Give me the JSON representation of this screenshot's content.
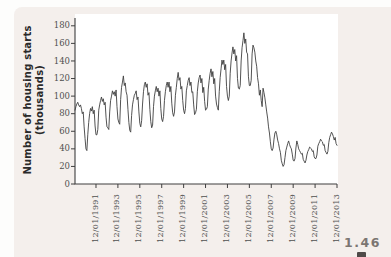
{
  "figure_number": "1.46",
  "chart_data": {
    "type": "line",
    "title": "",
    "xlabel": "",
    "ylabel": "Number of housing starts (thousands)",
    "ylabel_line1": "Number of housing starts",
    "ylabel_line2": "(thousands)",
    "ylim": [
      0,
      180
    ],
    "y_ticks": [
      180,
      160,
      140,
      120,
      100,
      80,
      60,
      40,
      20,
      0
    ],
    "grid": "off",
    "legend": "none",
    "line_color": "#3f3f3f",
    "plot_background": "#ffffff",
    "panel_background": "#f4efec",
    "x_start": "01/1990",
    "frequency_months": 1,
    "x_ticks": [
      {
        "label": "12/01/1991",
        "month_index": 23
      },
      {
        "label": "12/01/1993",
        "month_index": 47
      },
      {
        "label": "12/01/1995",
        "month_index": 71
      },
      {
        "label": "12/01/1997",
        "month_index": 95
      },
      {
        "label": "12/01/1999",
        "month_index": 119
      },
      {
        "label": "12/01/2001",
        "month_index": 143
      },
      {
        "label": "12/01/2003",
        "month_index": 167
      },
      {
        "label": "12/01/2005",
        "month_index": 191
      },
      {
        "label": "12/01/2007",
        "month_index": 215
      },
      {
        "label": "12/01/2009",
        "month_index": 239
      },
      {
        "label": "12/01/2011",
        "month_index": 263
      },
      {
        "label": "12/01/2013",
        "month_index": 287
      }
    ],
    "values": [
      84,
      88,
      91,
      93,
      90,
      88,
      90,
      86,
      80,
      82,
      65,
      52,
      40,
      38,
      56,
      70,
      80,
      86,
      83,
      88,
      80,
      84,
      66,
      56,
      56,
      62,
      84,
      90,
      95,
      99,
      94,
      97,
      90,
      93,
      76,
      65,
      64,
      62,
      82,
      95,
      100,
      106,
      102,
      105,
      100,
      107,
      88,
      74,
      70,
      68,
      96,
      110,
      116,
      123,
      112,
      115,
      105,
      101,
      85,
      70,
      61,
      59,
      78,
      90,
      96,
      101,
      103,
      106,
      96,
      99,
      82,
      69,
      65,
      72,
      91,
      105,
      113,
      116,
      110,
      114,
      101,
      104,
      85,
      71,
      64,
      67,
      88,
      100,
      106,
      111,
      105,
      109,
      100,
      106,
      86,
      74,
      71,
      77,
      95,
      105,
      112,
      116,
      110,
      116,
      105,
      111,
      92,
      81,
      77,
      82,
      101,
      110,
      120,
      127,
      118,
      121,
      108,
      111,
      95,
      84,
      80,
      86,
      106,
      112,
      118,
      121,
      112,
      116,
      104,
      105,
      90,
      79,
      81,
      85,
      105,
      115,
      121,
      124,
      115,
      120,
      104,
      110,
      94,
      84,
      85,
      88,
      108,
      118,
      126,
      131,
      122,
      128,
      114,
      120,
      100,
      91,
      87,
      84,
      105,
      121,
      131,
      141,
      136,
      141,
      130,
      136,
      111,
      100,
      95,
      100,
      126,
      140,
      149,
      156,
      148,
      153,
      140,
      146,
      120,
      109,
      108,
      112,
      140,
      155,
      163,
      172,
      160,
      165,
      150,
      148,
      122,
      112,
      112,
      118,
      148,
      158,
      155,
      150,
      140,
      134,
      121,
      114,
      101,
      107,
      95,
      88,
      109,
      104,
      98,
      90,
      82,
      75,
      65,
      58,
      48,
      40,
      38,
      41,
      51,
      58,
      60,
      56,
      50,
      46,
      40,
      36,
      27,
      23,
      20,
      22,
      30,
      38,
      42,
      46,
      49,
      45,
      42,
      40,
      34,
      27,
      26,
      29,
      41,
      49,
      45,
      40,
      38,
      36,
      34,
      35,
      28,
      26,
      24,
      27,
      33,
      37,
      39,
      42,
      41,
      40,
      37,
      38,
      31,
      29,
      29,
      33,
      43,
      46,
      48,
      51,
      49,
      48,
      44,
      45,
      38,
      36,
      34,
      37,
      47,
      53,
      56,
      59,
      57,
      54,
      50,
      53,
      46,
      44
    ]
  }
}
